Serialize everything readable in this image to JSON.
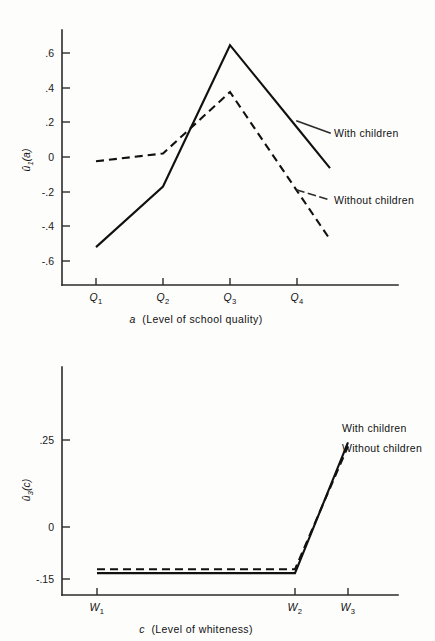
{
  "figure": {
    "background_color": "#fdfdfc",
    "ink_color": "#111111"
  },
  "chart_data": [
    {
      "id": "utility-school-quality",
      "type": "line",
      "title": "",
      "xlabel_italic": "a",
      "xlabel_rest": "(Level of school quality)",
      "xlabel": "a (Level of school quality)",
      "ylabel": "û1(a)",
      "ylabel_base": "û",
      "ylabel_sub": "1",
      "ylabel_tail": "(a)",
      "categories": [
        "Q1",
        "Q2",
        "Q3",
        "Q4"
      ],
      "category_labels_base": [
        "Q",
        "Q",
        "Q",
        "Q"
      ],
      "category_labels_sub": [
        "1",
        "2",
        "3",
        "4"
      ],
      "yticks": [
        0.6,
        0.4,
        0.2,
        0.0,
        -0.2,
        -0.4,
        -0.6
      ],
      "ytick_labels": [
        ".6",
        ".4",
        ".2",
        "0",
        "-.2",
        "-.4",
        "-.6"
      ],
      "ylim": [
        -0.72,
        0.78
      ],
      "grid": false,
      "legend_position": "right-inline",
      "series": [
        {
          "name": "With children",
          "style": "solid",
          "values": [
            -0.52,
            -0.17,
            0.645,
            0.17
          ],
          "label": "With children"
        },
        {
          "name": "Without children",
          "style": "dashed",
          "values": [
            -0.025,
            0.02,
            0.375,
            -0.195
          ],
          "label": "Without children"
        }
      ]
    },
    {
      "id": "utility-whiteness",
      "type": "line",
      "title": "",
      "xlabel_italic": "c",
      "xlabel_rest": "(Level of whiteness)",
      "xlabel": "c (Level of whiteness)",
      "ylabel": "û3(c)",
      "ylabel_base": "û",
      "ylabel_sub": "3",
      "ylabel_tail": "(c)",
      "categories": [
        "W1",
        "W2",
        "W3"
      ],
      "category_labels_base": [
        "W",
        "W",
        "W"
      ],
      "category_labels_sub": [
        "1",
        "2",
        "3"
      ],
      "yticks": [
        0.25,
        0.0,
        -0.15
      ],
      "ytick_labels": [
        ".25",
        "0",
        "-.15"
      ],
      "ylim": [
        -0.195,
        0.36
      ],
      "grid": false,
      "legend_position": "top-right",
      "series": [
        {
          "name": "With children",
          "style": "solid",
          "values": [
            -0.133,
            -0.133,
            0.243
          ],
          "label": "With children"
        },
        {
          "name": "Without children",
          "style": "dashed",
          "values": [
            -0.122,
            -0.122,
            0.232
          ],
          "label": "Without children"
        }
      ]
    }
  ]
}
